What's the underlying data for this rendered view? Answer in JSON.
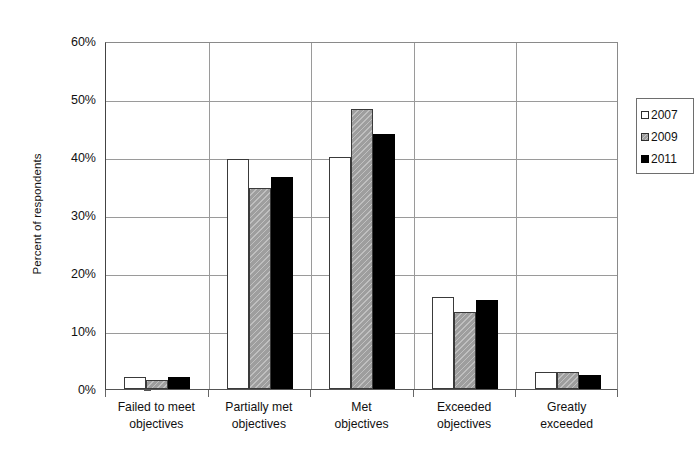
{
  "chart_data": {
    "type": "bar",
    "title": "",
    "subtitle": "",
    "xlabel": "",
    "ylabel": "Percent of respondents",
    "ylim": [
      0,
      60
    ],
    "ytick_values": [
      0,
      10,
      20,
      30,
      40,
      50,
      60
    ],
    "ytick_labels": [
      "0%",
      "10%",
      "20%",
      "30%",
      "40%",
      "50%",
      "60%"
    ],
    "grid": "horizontal",
    "legend_position": "top-right-inside",
    "categories": [
      "Failed to meet objectives",
      "Partially met objectives",
      "Met objectives",
      "Exceeded objectives",
      "Greatly exceeded"
    ],
    "category_label_lines": [
      [
        "Failed to meet",
        "objectives"
      ],
      [
        "Partially met",
        "objectives"
      ],
      [
        "Met",
        "objectives"
      ],
      [
        "Exceeded",
        "objectives"
      ],
      [
        "Greatly",
        "exceeded"
      ]
    ],
    "series": [
      {
        "name": "2007",
        "color": "#ffffff",
        "values": [
          2.1,
          39.6,
          40.0,
          15.8,
          3.0
        ]
      },
      {
        "name": "2009",
        "color": "#9e9e9e",
        "values": [
          1.6,
          34.7,
          48.3,
          13.2,
          2.9
        ]
      },
      {
        "name": "2011",
        "color": "#000000",
        "values": [
          2.1,
          36.6,
          44.0,
          15.4,
          2.5
        ]
      }
    ],
    "annotations": []
  },
  "axis": {
    "y_title": "Percent of respondents"
  },
  "legend": {
    "entries": [
      {
        "label": "2007",
        "swatch": "white-square-icon"
      },
      {
        "label": "2009",
        "swatch": "gray-square-icon"
      },
      {
        "label": "2011",
        "swatch": "black-square-icon"
      }
    ]
  },
  "colors": {
    "series_2007": "#ffffff",
    "series_2009": "#9e9e9e",
    "series_2011": "#000000",
    "gridline": "#9a9a9a",
    "axis": "#444444",
    "text": "#111111",
    "background": "#ffffff"
  }
}
